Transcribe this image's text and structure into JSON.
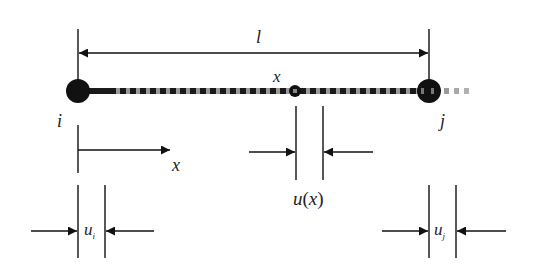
{
  "diagram": {
    "type": "bar-element-displacement",
    "colors": {
      "ink": "#111111",
      "beam_dark": "#1a1a1a",
      "beam_light": "#9a9a9a",
      "label": "#222222",
      "background": "#ffffff"
    },
    "labels": {
      "length": "l",
      "position_point": "x",
      "node_i": "i",
      "node_j": "j",
      "axis": "x",
      "disp_x_u": "u",
      "disp_x_open": "(",
      "disp_x_var": "x",
      "disp_x_close": ")",
      "disp_i_base": "u",
      "disp_i_sub": "i",
      "disp_j_base": "u",
      "disp_j_sub": "j"
    },
    "nodes": [
      {
        "id": "i",
        "role": "start-node"
      },
      {
        "id": "x",
        "role": "interior-point"
      },
      {
        "id": "j",
        "role": "end-node"
      }
    ]
  }
}
